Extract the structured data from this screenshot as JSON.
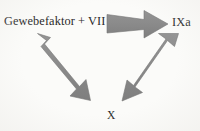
{
  "diagram": {
    "background_color": "#fbfbf9",
    "arrow_fill_color": "#8a8a8a",
    "arrow_edge_color": "#6f6f6f",
    "text_color": "#2a2a2a",
    "nodes": [
      {
        "id": "tissue-factor",
        "label": "Gewebefaktor + VII",
        "position": "top-left"
      },
      {
        "id": "ixa",
        "label": "IXa",
        "position": "top-right"
      },
      {
        "id": "x",
        "label": "X",
        "position": "bottom-center"
      }
    ],
    "arrows": [
      {
        "id": "arrow-tf-to-ixa",
        "icon": "block-arrow-right-icon",
        "from": "tissue-factor",
        "to": "ixa",
        "direction": "right"
      },
      {
        "id": "arrow-tf-to-x",
        "icon": "block-arrow-down-right-icon",
        "from": "tissue-factor",
        "to": "x",
        "direction": "down-right"
      },
      {
        "id": "arrow-ixa-to-x",
        "icon": "block-arrow-down-left-icon",
        "from": "ixa",
        "to": "x",
        "direction": "down-left"
      }
    ]
  }
}
